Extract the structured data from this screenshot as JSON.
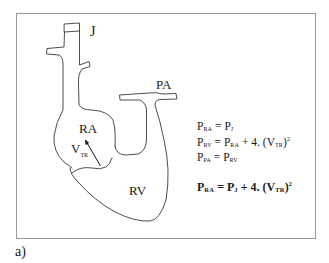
{
  "figure": {
    "caption": "a)",
    "labels": {
      "jugular": "J",
      "pulmonary_artery": "PA",
      "right_atrium": "RA",
      "right_ventricle": "RV",
      "velocity_main": "V",
      "velocity_sub": "TR"
    },
    "equations": [
      {
        "lhs_main": "P",
        "lhs_sub": "RA",
        "op": " = ",
        "rhs": [
          {
            "main": "P",
            "sub": "J"
          }
        ],
        "tail": ""
      },
      {
        "lhs_main": "P",
        "lhs_sub": "RV",
        "op": " = ",
        "rhs": [
          {
            "main": "P",
            "sub": "RA"
          }
        ],
        "tail_pre": " + 4. (V",
        "tail_sub": "TR",
        "tail_post": ")",
        "tail_sup": "2"
      },
      {
        "lhs_main": "P",
        "lhs_sub": "PA",
        "op": " = ",
        "rhs": [
          {
            "main": "P",
            "sub": "RV"
          }
        ],
        "tail": ""
      }
    ],
    "result_equation": {
      "lhs_main": "P",
      "lhs_sub": "RA",
      "op": " = ",
      "rhs_main": "P",
      "rhs_sub": "J",
      "tail_pre": " + 4. (V",
      "tail_sub": "TR",
      "tail_post": ")",
      "tail_sup": "2"
    },
    "colors": {
      "line": "#3a3a3a",
      "frame": "#9a9a9a",
      "text": "#1a1a1a"
    }
  }
}
